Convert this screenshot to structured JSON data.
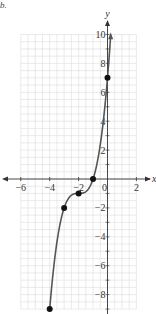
{
  "label": "b.",
  "chart_data": {
    "type": "line",
    "title": "",
    "xlabel": "x",
    "ylabel": "y",
    "xlim": [
      -6.5,
      2.6
    ],
    "ylim": [
      -9.2,
      10.6
    ],
    "grid": true,
    "x_ticks": [
      -6,
      -4,
      -2,
      0,
      2
    ],
    "x_tick_labels": [
      "−6",
      "−4",
      "−2",
      "0",
      "2"
    ],
    "y_ticks": [
      -8,
      -6,
      -4,
      -2,
      2,
      4,
      6,
      8,
      10
    ],
    "y_tick_labels": [
      "−8",
      "−6",
      "−4",
      "−2",
      "2",
      "4",
      "6",
      "8",
      "10"
    ],
    "function": "y = (x+2)^3 - 1",
    "domain": [
      -4,
      0.22
    ],
    "points": [
      {
        "x": -4,
        "y": -9
      },
      {
        "x": -3,
        "y": -2
      },
      {
        "x": -2,
        "y": -1
      },
      {
        "x": -1,
        "y": 0
      },
      {
        "x": 0,
        "y": 7
      }
    ],
    "end_arrow": "up",
    "curve_color": "#555555",
    "point_color": "#111111",
    "grid_color": "#dcdcdc",
    "axis_color": "#333333"
  }
}
